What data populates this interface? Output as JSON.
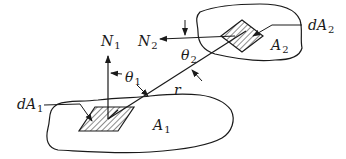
{
  "diagram": {
    "labels": {
      "N1": {
        "base": "N",
        "sub": "1"
      },
      "N2": {
        "base": "N",
        "sub": "2"
      },
      "theta1": {
        "base": "θ",
        "sub": "1"
      },
      "theta2": {
        "base": "θ",
        "sub": "2"
      },
      "r": {
        "base": "r",
        "sub": ""
      },
      "dA1": {
        "base": "dA",
        "sub": "1"
      },
      "dA2": {
        "base": "dA",
        "sub": "2"
      },
      "A1": {
        "base": "A",
        "sub": "1"
      },
      "A2": {
        "base": "A",
        "sub": "2"
      }
    },
    "elements": [
      {
        "id": "surface-A1",
        "type": "closed-curve",
        "label": "A1"
      },
      {
        "id": "surface-A2",
        "type": "closed-curve",
        "label": "A2"
      },
      {
        "id": "element-dA1",
        "type": "hatched-parallelogram",
        "label": "dA1"
      },
      {
        "id": "element-dA2",
        "type": "hatched-diamond",
        "label": "dA2"
      },
      {
        "id": "normal-N1",
        "type": "arrow",
        "direction": "up",
        "label": "N1"
      },
      {
        "id": "normal-N2",
        "type": "arrow",
        "direction": "left",
        "label": "N2"
      },
      {
        "id": "line-r",
        "type": "line",
        "from": "dA1",
        "to": "dA2",
        "label": "r"
      },
      {
        "id": "angle-theta1",
        "between": [
          "N1",
          "r"
        ],
        "label": "θ1"
      },
      {
        "id": "angle-theta2",
        "between": [
          "N2",
          "r"
        ],
        "label": "θ2"
      }
    ],
    "colors": {
      "stroke": "#1a1a1a",
      "background": "#ffffff"
    }
  }
}
